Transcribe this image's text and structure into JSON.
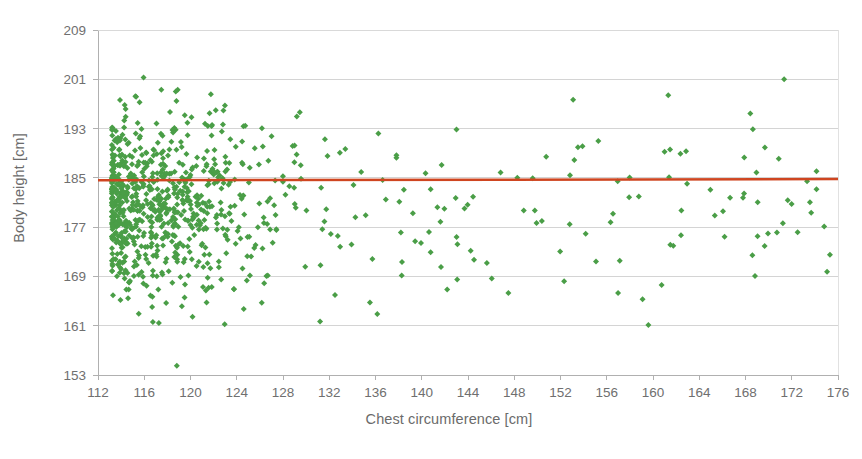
{
  "chart_data": {
    "type": "scatter",
    "title": "",
    "xlabel": "Chest circumference [cm]",
    "ylabel": "Body height [cm]",
    "xlim": [
      112,
      176
    ],
    "ylim": [
      153,
      209
    ],
    "xticks": [
      112,
      116,
      120,
      124,
      128,
      132,
      136,
      140,
      144,
      148,
      152,
      156,
      160,
      164,
      168,
      172,
      176
    ],
    "yticks": [
      153,
      161,
      169,
      177,
      185,
      193,
      201,
      209
    ],
    "grid": "horizontal",
    "legend": "none",
    "marker": {
      "shape": "diamond",
      "color": "#4a9e47",
      "size_px": 6
    },
    "series": [
      {
        "name": "Observations",
        "n_points": 900,
        "x_mean": 122.5,
        "x_skew": "right-skewed, dense 113-133, sparse tail to 176",
        "y_mean": 180.6,
        "y_sd": 7.2
      }
    ],
    "trendline": {
      "name": "Linear regression",
      "color": "#cf4520",
      "width_px": 2.5,
      "y_at_x_min": 184.6,
      "y_at_x_max": 184.8,
      "slope": 0.003,
      "description": "nearly horizontal line at about 184.7 cm"
    }
  },
  "axes": {
    "y_tick_labels": [
      "209",
      "201",
      "193",
      "185",
      "177",
      "169",
      "161",
      "153"
    ],
    "x_tick_labels": [
      "112",
      "116",
      "120",
      "124",
      "128",
      "132",
      "136",
      "140",
      "144",
      "148",
      "152",
      "156",
      "160",
      "164",
      "168",
      "172",
      "176"
    ],
    "y_title": "Body height [cm]",
    "x_title": "Chest circumference [cm]"
  },
  "colors": {
    "marker_green": "#4a9e47",
    "trendline_red": "#cf4520",
    "gridline_gray": "#c9c9c9",
    "axis_gray": "#b0b0b0",
    "text_gray": "#6b6b6b",
    "background": "#ffffff"
  }
}
